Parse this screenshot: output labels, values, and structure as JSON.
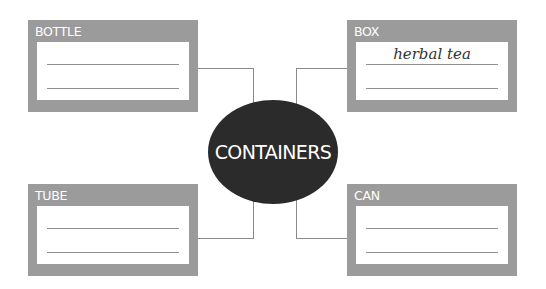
{
  "diagram": {
    "center": {
      "label": "CONTAINERS",
      "fill": "#2b2b2b"
    },
    "cards": [
      {
        "id": "bottle",
        "title": "BOTTLE",
        "answers": [
          "",
          ""
        ]
      },
      {
        "id": "box",
        "title": "BOX",
        "answers": [
          "herbal tea",
          ""
        ]
      },
      {
        "id": "tube",
        "title": "TUBE",
        "answers": [
          "",
          ""
        ]
      },
      {
        "id": "can",
        "title": "CAN",
        "answers": [
          "",
          ""
        ]
      }
    ],
    "colors": {
      "card_frame": "#9b9b9b",
      "connector": "#8a8a8a",
      "text_light": "#ffffff"
    }
  }
}
